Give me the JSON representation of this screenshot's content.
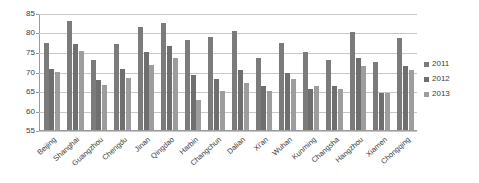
{
  "chart_data": {
    "type": "bar",
    "title": "",
    "subtitle": "",
    "xlabel": "",
    "ylabel": "",
    "ylim": [
      55,
      85
    ],
    "ytick_step": 5,
    "yticks": [
      85,
      80,
      75,
      70,
      65,
      60,
      55
    ],
    "grid": true,
    "legend_position": "right",
    "categories": [
      "Beijing",
      "Shanghai",
      "Guangzhou",
      "Chengdu",
      "Jinan",
      "Qingdao",
      "Harbin",
      "Changchun",
      "Dalian",
      "Xi'an",
      "Wuhan",
      "Kunming",
      "Changsha",
      "Hangzhou",
      "Xiamen",
      "Chongqing"
    ],
    "series": [
      {
        "name": "2011",
        "color": "#7b7b7b",
        "values": [
          77.4,
          83.3,
          73.1,
          77.3,
          81.7,
          82.8,
          78.3,
          79.1,
          80.6,
          73.5,
          77.5,
          75.1,
          73.2,
          80.3,
          72.7,
          78.9
        ]
      },
      {
        "name": "2012",
        "color": "#6f6f6f",
        "values": [
          70.7,
          77.3,
          68.0,
          70.9,
          75.3,
          76.7,
          69.2,
          68.2,
          70.5,
          66.4,
          69.7,
          65.6,
          66.4,
          73.5,
          64.7,
          71.5
        ]
      },
      {
        "name": "2013",
        "color": "#9d9d9d",
        "values": [
          70.0,
          75.4,
          66.6,
          68.4,
          71.9,
          73.7,
          62.8,
          65.1,
          67.2,
          65.1,
          68.2,
          66.4,
          65.6,
          71.5,
          64.6,
          70.4
        ]
      }
    ]
  },
  "legend": {
    "items": [
      {
        "label": "2011"
      },
      {
        "label": "2012"
      },
      {
        "label": "2013"
      }
    ]
  }
}
